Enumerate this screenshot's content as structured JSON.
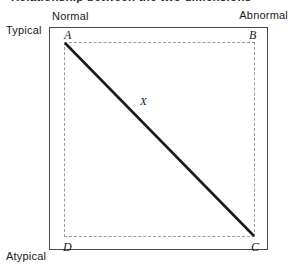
{
  "figure": {
    "title_partial": "Relationship between the two dimensions",
    "background_color": "#ffffff"
  },
  "axes": {
    "horizontal": {
      "left_pole": "Normal",
      "right_pole": "Abnormal"
    },
    "vertical": {
      "top_pole": "Typical",
      "bottom_pole": "Atypical"
    }
  },
  "frame": {
    "outer_border_color": "#4a4a4a",
    "dashed_border_color": "#9a9a9a"
  },
  "vertices": {
    "a": "A",
    "b": "B",
    "c": "C",
    "d": "D"
  },
  "points": {
    "x": "X"
  },
  "diagonal": {
    "color": "#1a1a1a",
    "from": "A",
    "to": "C"
  }
}
